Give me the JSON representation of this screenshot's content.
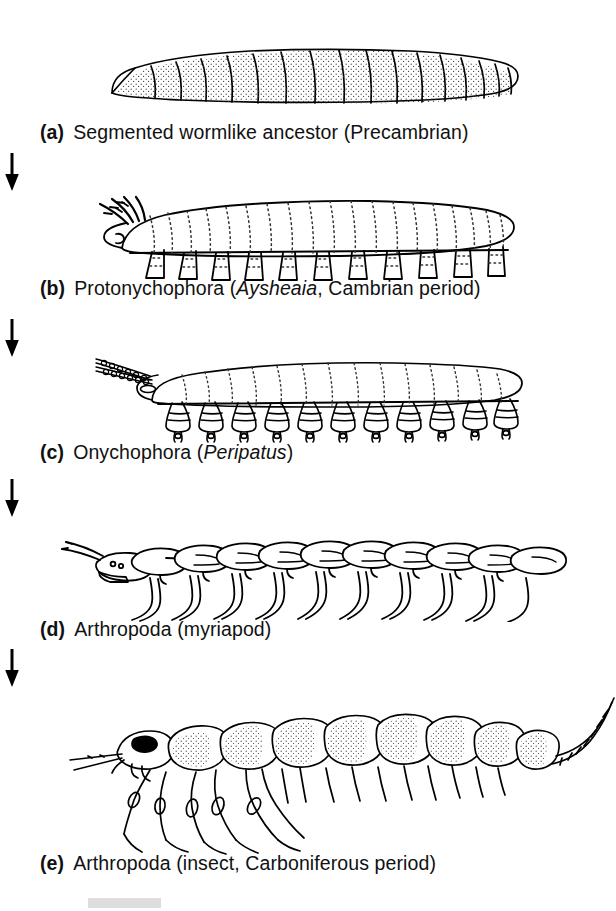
{
  "figure": {
    "background_color": "#ffffff",
    "ink_color": "#000000",
    "panel_count": 5
  },
  "panels": [
    {
      "label": "(a)",
      "text_before": "Segmented wormlike ancestor (Precambrian)",
      "scientific_name": "",
      "text_after": "",
      "organism": "segmented-worm",
      "icon_name": "segmented-worm-illustration"
    },
    {
      "label": "(b)",
      "text_before": "Protonychophora (",
      "scientific_name": "Aysheaia",
      "text_after": ", Cambrian period)",
      "organism": "aysheaia",
      "icon_name": "aysheaia-illustration"
    },
    {
      "label": "(c)",
      "text_before": "Onychophora (",
      "scientific_name": "Peripatus",
      "text_after": ")",
      "organism": "peripatus",
      "icon_name": "peripatus-illustration"
    },
    {
      "label": "(d)",
      "text_before": "Arthropoda (myriapod)",
      "scientific_name": "",
      "text_after": "",
      "organism": "myriapod",
      "icon_name": "myriapod-illustration"
    },
    {
      "label": "(e)",
      "text_before": "Arthropoda (insect, Carboniferous period)",
      "scientific_name": "",
      "text_after": "",
      "organism": "insect",
      "icon_name": "insect-illustration"
    }
  ],
  "arrows": {
    "symbol": "down-arrow",
    "count": 4,
    "direction": "down"
  }
}
